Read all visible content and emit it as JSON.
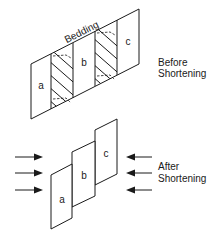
{
  "diagram": {
    "before": {
      "caption_line1": "Before",
      "caption_line2": "Shortening",
      "bedding_label": "Bedding",
      "blocks": [
        {
          "label": "a",
          "hatched": false
        },
        {
          "label": "",
          "hatched": true
        },
        {
          "label": "b",
          "hatched": false
        },
        {
          "label": "",
          "hatched": true
        },
        {
          "label": "c",
          "hatched": false
        }
      ]
    },
    "after": {
      "caption_line1": "After",
      "caption_line2": "Shortening",
      "blocks": [
        {
          "label": "a"
        },
        {
          "label": "b"
        },
        {
          "label": "c"
        }
      ],
      "arrows_left_count": 3,
      "arrows_right_count": 3,
      "arrow_direction_left": "pointing-right",
      "arrow_direction_right": "pointing-left"
    }
  }
}
